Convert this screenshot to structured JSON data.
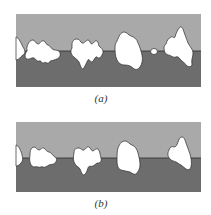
{
  "figure": {
    "panels": [
      {
        "id": "a",
        "caption": "(a)",
        "phases": {
          "upper": {
            "color": "#a8a8a8"
          },
          "lower": {
            "color": "#6e6e6e"
          },
          "particle": {
            "color": "#ffffff"
          },
          "interface_line": {
            "color": "#2e2e2e"
          }
        },
        "particle_count": 6
      },
      {
        "id": "b",
        "caption": "(b)",
        "phases": {
          "upper": {
            "color": "#a8a8a8"
          },
          "lower": {
            "color": "#6e6e6e"
          },
          "particle": {
            "color": "#ffffff"
          },
          "interface_line": {
            "color": "#2e2e2e"
          }
        },
        "particle_count": 5
      }
    ]
  }
}
